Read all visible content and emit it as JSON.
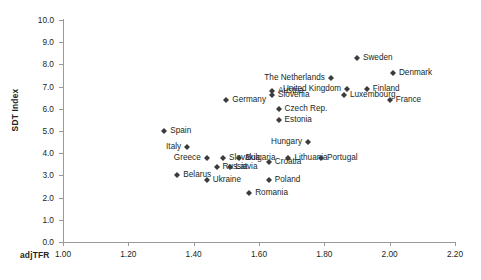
{
  "chart_data": {
    "type": "scatter",
    "title": "",
    "xlabel": "adjTFR",
    "ylabel": "SDT Index",
    "xlim": [
      1.0,
      2.2
    ],
    "ylim": [
      0.0,
      10.0
    ],
    "xticks": [
      "1.00",
      "1.20",
      "1.40",
      "1.60",
      "1.80",
      "2.00",
      "2.20"
    ],
    "yticks": [
      "0.0",
      "1.0",
      "2.0",
      "3.0",
      "4.0",
      "5.0",
      "6.0",
      "7.0",
      "8.0",
      "9.0",
      "10.0"
    ],
    "grid": false,
    "legend": "none",
    "marker": "diamond",
    "marker_color": "#3b3b3b",
    "points": [
      {
        "label": "Sweden",
        "x": 1.9,
        "y": 8.3,
        "label_side": "right"
      },
      {
        "label": "Denmark",
        "x": 2.01,
        "y": 7.6,
        "label_side": "right"
      },
      {
        "label": "The Netherlands",
        "x": 1.82,
        "y": 7.4,
        "label_side": "left"
      },
      {
        "label": "United Kingdom",
        "x": 1.87,
        "y": 6.9,
        "label_side": "left"
      },
      {
        "label": "Finland",
        "x": 1.93,
        "y": 6.9,
        "label_side": "right"
      },
      {
        "label": "France",
        "x": 2.0,
        "y": 6.4,
        "label_side": "right"
      },
      {
        "label": "Luxembourg",
        "x": 1.86,
        "y": 6.6,
        "label_side": "right"
      },
      {
        "label": "Austria",
        "x": 1.64,
        "y": 6.8,
        "label_side": "right"
      },
      {
        "label": "Slovenia",
        "x": 1.64,
        "y": 6.6,
        "label_side": "right"
      },
      {
        "label": "Germany",
        "x": 1.5,
        "y": 6.4,
        "label_side": "right"
      },
      {
        "label": "Czech Rep.",
        "x": 1.66,
        "y": 6.0,
        "label_side": "right"
      },
      {
        "label": "Estonia",
        "x": 1.66,
        "y": 5.5,
        "label_side": "right"
      },
      {
        "label": "Hungary",
        "x": 1.75,
        "y": 4.5,
        "label_side": "left"
      },
      {
        "label": "Spain",
        "x": 1.31,
        "y": 5.0,
        "label_side": "right"
      },
      {
        "label": "Italy",
        "x": 1.38,
        "y": 4.3,
        "label_side": "left"
      },
      {
        "label": "Slovakia",
        "x": 1.49,
        "y": 3.8,
        "label_side": "right"
      },
      {
        "label": "Bulgaria",
        "x": 1.54,
        "y": 3.8,
        "label_side": "right"
      },
      {
        "label": "Greece",
        "x": 1.44,
        "y": 3.8,
        "label_side": "left"
      },
      {
        "label": "Lithuania",
        "x": 1.69,
        "y": 3.8,
        "label_side": "right"
      },
      {
        "label": "Portugal",
        "x": 1.79,
        "y": 3.8,
        "label_side": "right"
      },
      {
        "label": "Russia",
        "x": 1.47,
        "y": 3.4,
        "label_side": "right"
      },
      {
        "label": "Latvia",
        "x": 1.51,
        "y": 3.4,
        "label_side": "right"
      },
      {
        "label": "Croatia",
        "x": 1.63,
        "y": 3.6,
        "label_side": "right"
      },
      {
        "label": "Belarus",
        "x": 1.35,
        "y": 3.0,
        "label_side": "right"
      },
      {
        "label": "Ukraine",
        "x": 1.44,
        "y": 2.8,
        "label_side": "right"
      },
      {
        "label": "Poland",
        "x": 1.63,
        "y": 2.8,
        "label_side": "right"
      },
      {
        "label": "Romania",
        "x": 1.57,
        "y": 2.2,
        "label_side": "right"
      }
    ]
  }
}
